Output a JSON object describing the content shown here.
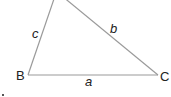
{
  "diagram": {
    "type": "triangle",
    "vertices": [
      {
        "label": "B"
      },
      {
        "label": "C"
      }
    ],
    "sides": [
      {
        "label": "a",
        "between": "B-C"
      },
      {
        "label": "b",
        "opposite": "B"
      },
      {
        "label": "c",
        "opposite": "C"
      }
    ],
    "colors": {
      "line": "#9a9a9a",
      "text": "#222222"
    }
  }
}
